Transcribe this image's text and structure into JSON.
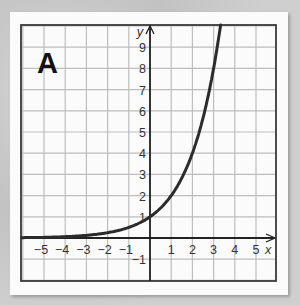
{
  "panel_label": "A",
  "colors": {
    "curve": "#2b2b2b",
    "grid": "#bdbdbd",
    "axis": "#222222",
    "frame": "#3a3a3a",
    "background": "#fbfbfb"
  },
  "chart_data": {
    "type": "line",
    "title": "A",
    "xlabel": "x",
    "ylabel": "y",
    "xlim": [
      -6,
      6
    ],
    "ylim": [
      -2,
      10
    ],
    "grid": true,
    "x_ticks": [
      -5,
      -4,
      -3,
      -2,
      -1,
      1,
      2,
      3,
      4,
      5
    ],
    "y_ticks": [
      -1,
      1,
      2,
      3,
      4,
      5,
      6,
      7,
      8,
      9
    ],
    "x_tick_labels": [
      "−5",
      "−4",
      "−3",
      "−2",
      "−1",
      "1",
      "2",
      "3",
      "4",
      "5"
    ],
    "y_tick_labels": [
      "−1",
      "1",
      "2",
      "3",
      "4",
      "5",
      "6",
      "7",
      "8",
      "9"
    ],
    "series": [
      {
        "name": "y = 2^x",
        "function": "2^x",
        "x": [
          -6,
          -5,
          -4,
          -3,
          -2,
          -1,
          0,
          1,
          2,
          3,
          3.3
        ],
        "values": [
          0.016,
          0.031,
          0.063,
          0.125,
          0.25,
          0.5,
          1,
          2,
          4,
          8,
          9.85
        ]
      }
    ]
  }
}
